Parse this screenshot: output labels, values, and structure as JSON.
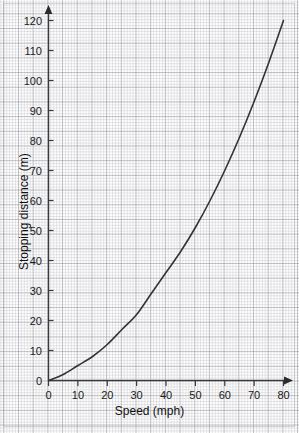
{
  "chart_data": {
    "type": "line",
    "title": "",
    "xlabel": "Speed (mph)",
    "ylabel": "Stopping distance (m)",
    "xlim": [
      0,
      80
    ],
    "ylim": [
      0,
      120
    ],
    "xticks": [
      0,
      10,
      20,
      30,
      40,
      50,
      60,
      70,
      80
    ],
    "yticks": [
      0,
      10,
      20,
      30,
      40,
      50,
      60,
      70,
      80,
      90,
      100,
      110,
      120
    ],
    "grid": true,
    "grid_style": "graph-paper",
    "legend": "none",
    "series": [
      {
        "name": "Stopping distance",
        "color": "#333333",
        "x": [
          0,
          5,
          10,
          15,
          20,
          25,
          30,
          35,
          40,
          45,
          50,
          55,
          60,
          65,
          70,
          75,
          80
        ],
        "values": [
          0,
          2,
          5,
          8,
          12,
          17,
          22,
          29,
          36,
          43,
          51,
          60,
          70,
          81,
          93,
          106,
          120
        ]
      }
    ]
  },
  "axes": {
    "x_title": "Speed (mph)",
    "y_title": "Stopping distance (m)",
    "x_tick_labels": [
      "0",
      "10",
      "20",
      "30",
      "40",
      "50",
      "60",
      "70",
      "80"
    ],
    "y_tick_labels": [
      "0",
      "10",
      "20",
      "30",
      "40",
      "50",
      "60",
      "70",
      "80",
      "90",
      "100",
      "110",
      "120"
    ],
    "axis_color": "#3a3a3a",
    "curve_color": "#333333",
    "grid_color": "#96969f",
    "background": "#fdfdfd"
  }
}
